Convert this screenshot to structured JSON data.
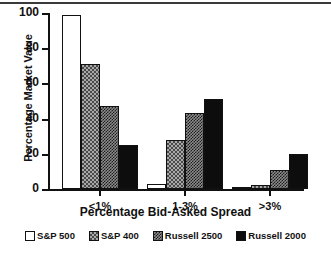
{
  "chart_data": {
    "type": "bar",
    "title": "",
    "subtitle": "",
    "xlabel": "Percentage Bid-Asked Spread",
    "ylabel": "Percentage Market Value",
    "categories": [
      "<1%",
      "1-3%",
      ">3%"
    ],
    "ylim": [
      0,
      100
    ],
    "yticks": [
      0,
      20,
      40,
      60,
      80,
      100
    ],
    "ytick_labels": [
      "0",
      "20",
      "40",
      "60",
      "80",
      "100"
    ],
    "grid": false,
    "legend_position": "bottom",
    "series": [
      {
        "name": "S&P 500",
        "fill": "empty",
        "values": [
          99,
          3,
          1
        ]
      },
      {
        "name": "S&P 400",
        "fill": "check-light",
        "values": [
          71,
          28,
          2
        ]
      },
      {
        "name": "Russell 2500",
        "fill": "check-dense",
        "values": [
          47,
          43,
          11
        ]
      },
      {
        "name": "Russell 2000",
        "fill": "solid",
        "values": [
          25,
          51,
          20
        ]
      }
    ]
  },
  "colors": {
    "axis": "#111111",
    "bar_outline": "#111111",
    "series_empty": "#ffffff",
    "series_light": "#a8a8a8",
    "series_dense": "#8c8c8c",
    "series_solid": "#0d0d0d",
    "background": "#ffffff"
  }
}
